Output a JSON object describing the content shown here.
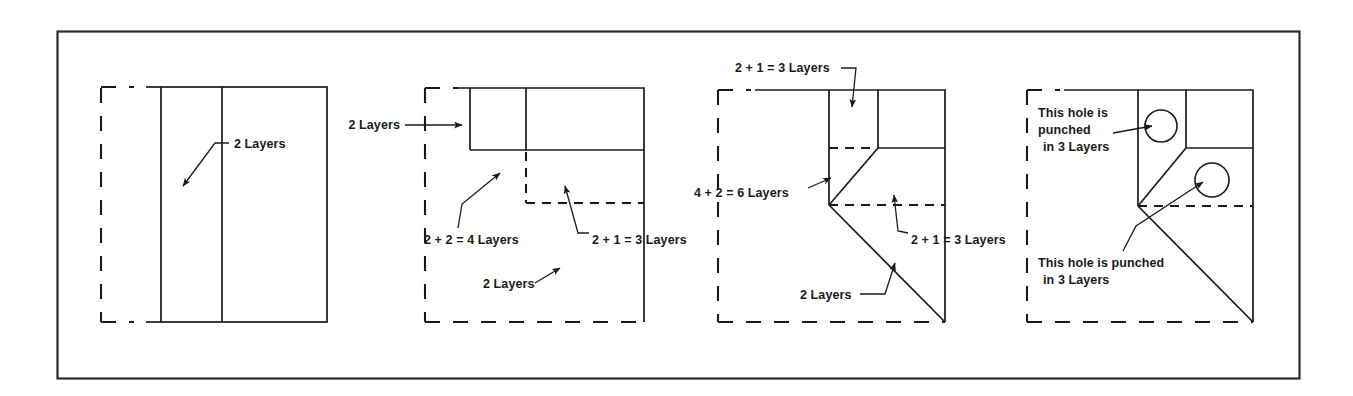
{
  "figure": {
    "border_color": "#2b2b2b",
    "line_color": "#1a1a1a",
    "background": "#ffffff",
    "panel_count": 4
  },
  "panels": [
    {
      "id": "panel-1",
      "name": "unfolded-sheet",
      "labels": [
        {
          "id": "p1-l1",
          "text": "2 Layers",
          "x": 232,
          "y": 146
        }
      ]
    },
    {
      "id": "panel-2",
      "name": "one-fold",
      "labels": [
        {
          "id": "p2-l1",
          "text": "2 Layers",
          "x": 359,
          "y": 128
        },
        {
          "id": "p2-l2",
          "text": "2 + 2 = 4 Layers",
          "x": 424,
          "y": 239
        },
        {
          "id": "p2-l3",
          "text": "2 + 1 = 3 Layers",
          "x": 588,
          "y": 239
        },
        {
          "id": "p2-l4",
          "text": "2 Layers",
          "x": 483,
          "y": 292
        }
      ]
    },
    {
      "id": "panel-3",
      "name": "two-folds",
      "labels": [
        {
          "id": "p3-l1",
          "text": "2 + 1 = 3 Layers",
          "x": 735,
          "y": 72
        },
        {
          "id": "p3-l2",
          "text": "4 + 2 = 6 Layers",
          "x": 694,
          "y": 192
        },
        {
          "id": "p3-l3",
          "text": "2 + 1 = 3 Layers",
          "x": 911,
          "y": 239
        },
        {
          "id": "p3-l4",
          "text": "2 Layers",
          "x": 800,
          "y": 299
        }
      ]
    },
    {
      "id": "panel-4",
      "name": "punched-holes",
      "labels": [
        {
          "id": "p4-l1",
          "lines": [
            "This hole is",
            "punched",
            "in 3 Layers"
          ],
          "x": 1038,
          "y": 113
        },
        {
          "id": "p4-l2",
          "lines": [
            "This hole is punched",
            "in 3 Layers"
          ],
          "x": 1038,
          "y": 262
        }
      ],
      "holes": [
        {
          "id": "hole-1",
          "cx": 1161,
          "cy": 126,
          "r": 16
        },
        {
          "id": "hole-2",
          "cx": 1212,
          "cy": 180,
          "r": 17
        }
      ]
    }
  ]
}
